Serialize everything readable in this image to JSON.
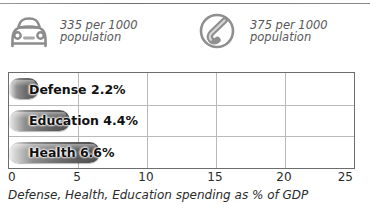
{
  "header": {
    "stats": [
      {
        "icon": "car-icon",
        "value_line": "335 per 1000",
        "unit_line": "population"
      },
      {
        "icon": "telephone-icon",
        "value_line": "375 per 1000",
        "unit_line": "population"
      }
    ]
  },
  "caption": "Defense, Health, Education spending as % of GDP",
  "colors": {
    "bar_dark": "#4e4e4e",
    "bar_light": "#f2f2f2",
    "frame": "#6d6d6d",
    "gridline": "#b9b9b9",
    "text": "#2b2b2b",
    "stat_text": "#58585a"
  },
  "chart_data": {
    "type": "bar",
    "orientation": "horizontal",
    "title": "",
    "subtitle": "",
    "xlabel": "Defense, Health, Education spending as % of GDP",
    "ylabel": "",
    "categories": [
      "Defense",
      "Education",
      "Health"
    ],
    "values": [
      2.2,
      4.4,
      6.6
    ],
    "data_labels": [
      "Defense 2.2%",
      "Education 4.4%",
      "Health 6.6%"
    ],
    "xlim": [
      0,
      25
    ],
    "xticks": [
      0,
      5,
      10,
      15,
      20,
      25
    ],
    "xtick_labels": [
      "0",
      "5",
      "10",
      "15",
      "20",
      "25"
    ],
    "grid": true,
    "legend": false,
    "units": "% of GDP"
  }
}
